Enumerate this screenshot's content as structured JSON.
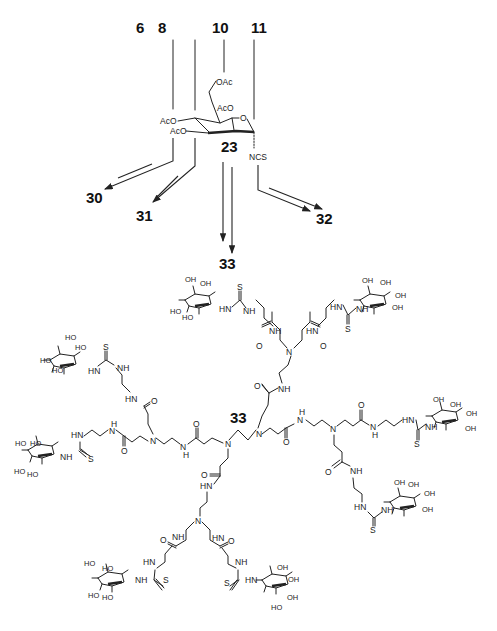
{
  "figure": {
    "reactant_labels": [
      "6",
      "8",
      "10",
      "11"
    ],
    "building_block": {
      "label": "23",
      "groups": {
        "c6": "OAc",
        "c2": "AcO",
        "c4": "AcO",
        "c3": "AcO",
        "ring_o": "O",
        "anomeric": "NCS"
      }
    },
    "product_labels": [
      "30",
      "31",
      "32",
      "33"
    ],
    "dendrimer_label": "33",
    "atoms": {
      "N": "N",
      "NH": "NH",
      "HN": "HN",
      "H": "H",
      "O": "O",
      "S": "S",
      "OH": "OH",
      "HO": "HO"
    }
  }
}
